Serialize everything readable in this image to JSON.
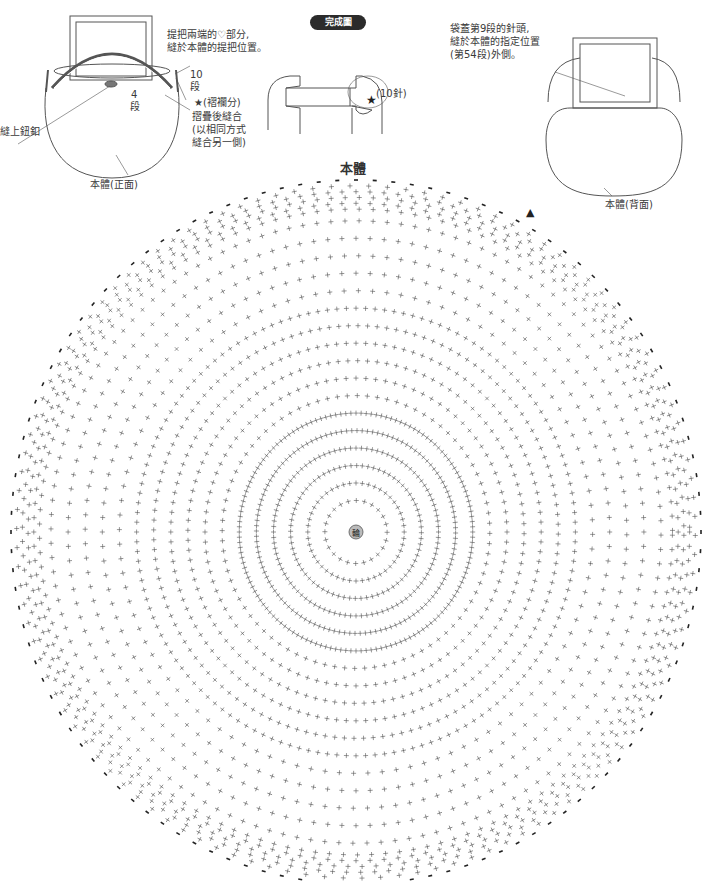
{
  "header": {
    "badge": "完成圖",
    "chart_title": "本體"
  },
  "front_view": {
    "caption": "本體(正面)",
    "notes": {
      "handle_note_line1": "提把兩端的♡部分,",
      "handle_note_line2": "縫於本體的提把位置。",
      "rows_10": "10",
      "rows_10_unit": "段",
      "rows_4": "4",
      "rows_4_unit": "段",
      "gusset": "★(褶襴分)",
      "fold_line1": "摺疊後縫合",
      "fold_line2": "(以相同方式",
      "fold_line3": "縫合另一側)",
      "button": "縫上鈕釦"
    }
  },
  "detail_view": {
    "stitch_count": "(10針)",
    "star": "★"
  },
  "back_view": {
    "caption": "本體(背面)",
    "note_line1": "袋蓋第9段的針頭,",
    "note_line2": "縫於本體的指定位置",
    "note_line3": "(第54段)外側。"
  },
  "chart_data": {
    "type": "crochet-chart",
    "title": "本體",
    "shape": "circle",
    "center_label": "輪",
    "center": [
      356,
      532
    ],
    "radius_x": 345,
    "radius_y": 352,
    "rows": 58,
    "sections": 8,
    "stitch_symbol": "+",
    "edge_symbol": "chain",
    "start_marker": "▲",
    "colors": {
      "ink": "#555555",
      "edge": "#222222",
      "labels": "#999999"
    }
  }
}
